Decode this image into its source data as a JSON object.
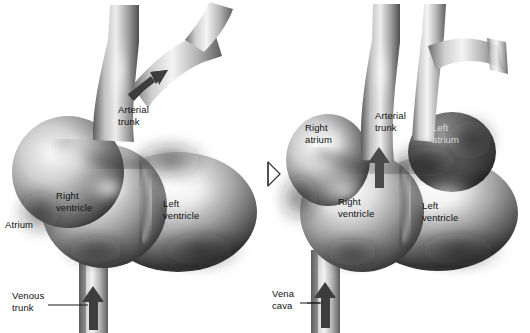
{
  "figure": {
    "background_color": "#ffffff",
    "ink_color": "#111111",
    "style": "grayscale airbrush anatomical illustration",
    "panel_count": 2
  },
  "transition": {
    "icon": "hollow-right-arrow-icon",
    "meaning": "develops into",
    "x": 267,
    "y": 168
  },
  "panels": [
    {
      "id": "early-heart",
      "stage_label": "",
      "labels": [
        {
          "id": "arterial-trunk",
          "text": "Arterial\ntrunk",
          "x": 118,
          "y": 104,
          "leader": false,
          "arrow": "flow-arrow-up-right"
        },
        {
          "id": "right-ventricle",
          "text": "Right\nventricle",
          "x": 56,
          "y": 190,
          "leader": false
        },
        {
          "id": "left-ventricle",
          "text": "Left\nventricle",
          "x": 163,
          "y": 198,
          "leader": false
        },
        {
          "id": "atrium",
          "text": "Atrium",
          "x": 5,
          "y": 219,
          "leader": false
        },
        {
          "id": "venous-trunk",
          "text": "Venous\ntrunk",
          "x": 12,
          "y": 290,
          "leader": true,
          "arrow": "flow-arrow-up"
        }
      ]
    },
    {
      "id": "mature-heart",
      "stage_label": "",
      "labels": [
        {
          "id": "right-atrium",
          "text": "Right\natrium",
          "x": 305,
          "y": 122,
          "leader": false
        },
        {
          "id": "arterial-trunk",
          "text": "Arterial\ntrunk",
          "x": 375,
          "y": 110,
          "leader": false,
          "arrow": "flow-arrow-up"
        },
        {
          "id": "left-atrium",
          "text": "Left\natrium",
          "x": 432,
          "y": 122,
          "leader": false,
          "dark_background": true
        },
        {
          "id": "right-ventricle",
          "text": "Right\nventricle",
          "x": 338,
          "y": 196,
          "leader": false
        },
        {
          "id": "left-ventricle",
          "text": "Left\nventricle",
          "x": 422,
          "y": 200,
          "leader": false
        },
        {
          "id": "vena-cava",
          "text": "Vena\ncava",
          "x": 272,
          "y": 288,
          "leader": true,
          "arrow": "flow-arrow-up"
        }
      ]
    }
  ],
  "colors": {
    "background": "#ffffff",
    "label_text": "#111111",
    "label_text_on_dark": "#d8d8d8",
    "flow_arrow": "#3a3a3a",
    "leader_line": "#1a1a1a",
    "tissue_light": "#f2f2f2",
    "tissue_mid": "#a8a8a8",
    "tissue_dark": "#4a4a4a",
    "tissue_shadow": "#2e2e2e"
  }
}
